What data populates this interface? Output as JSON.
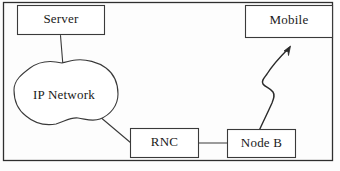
{
  "figure": {
    "type": "network-architecture-diagram",
    "background_color": "#fdfdfd",
    "stroke_color": "#3a3a3a",
    "text_color": "#1a1a1a",
    "frame": {
      "x": 3,
      "y": 2,
      "width": 330,
      "height": 159
    }
  },
  "nodes": [
    {
      "id": "server",
      "label": "Server",
      "shape": "rectangle",
      "x": 17,
      "y": 5,
      "width": 88,
      "height": 30
    },
    {
      "id": "mobile",
      "label": "Mobile",
      "shape": "rectangle",
      "x": 245,
      "y": 5,
      "width": 88,
      "height": 33
    },
    {
      "id": "ip_network",
      "label": "IP Network",
      "shape": "cloud",
      "x": 14,
      "y": 62,
      "width": 104,
      "height": 64
    },
    {
      "id": "rnc",
      "label": "RNC",
      "shape": "rectangle",
      "x": 130,
      "y": 128,
      "width": 69,
      "height": 30
    },
    {
      "id": "node_b",
      "label": "Node B",
      "shape": "rectangle",
      "x": 227,
      "y": 129,
      "width": 69,
      "height": 29
    }
  ],
  "links": [
    {
      "id": "server-to-ip-network",
      "from": "server",
      "to": "ip_network",
      "style": "solid-line"
    },
    {
      "id": "ip-network-to-rnc",
      "from": "ip_network",
      "to": "rnc",
      "style": "solid-line"
    },
    {
      "id": "rnc-to-node-b",
      "from": "rnc",
      "to": "node_b",
      "style": "solid-line"
    },
    {
      "id": "node-b-to-mobile",
      "from": "node_b",
      "to": "mobile",
      "style": "zigzag-arrow-wireless"
    }
  ]
}
